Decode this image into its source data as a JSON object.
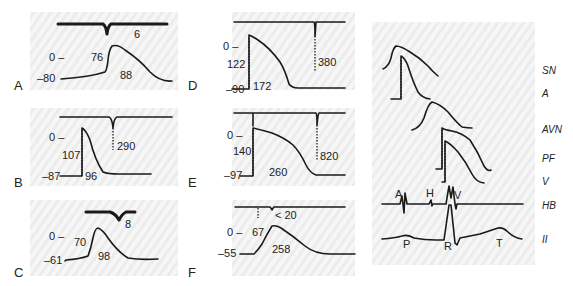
{
  "figure": {
    "panels": [
      {
        "letter": "A",
        "zero_label": "0 –",
        "resting_potential": "–80",
        "amplitude": "76",
        "duration": "88",
        "delay": "6"
      },
      {
        "letter": "B",
        "zero_label": "0 –",
        "resting_potential": "–87",
        "amplitude": "107",
        "duration": "96",
        "delay": "290"
      },
      {
        "letter": "C",
        "zero_label": "0 –",
        "resting_potential": "–61",
        "amplitude": "70",
        "duration": "98",
        "delay": "8"
      },
      {
        "letter": "D",
        "zero_label": "0 –",
        "resting_potential": "–90",
        "amplitude": "122",
        "duration": "172",
        "delay": "380"
      },
      {
        "letter": "E",
        "zero_label": "0 –",
        "resting_potential": "–97",
        "amplitude": "140",
        "duration": "260",
        "delay": "820"
      },
      {
        "letter": "F",
        "zero_label": "0 –",
        "resting_potential": "–55",
        "amplitude": "67",
        "duration": "258",
        "delay": "< 20"
      }
    ],
    "right_panel": {
      "tissue_labels": [
        "SN",
        "A",
        "AVN",
        "PF",
        "V",
        "HB",
        "II"
      ],
      "hb_wave_labels": [
        "A",
        "H",
        "V"
      ],
      "ecg_wave_labels": [
        "P",
        "R",
        "T"
      ]
    }
  }
}
